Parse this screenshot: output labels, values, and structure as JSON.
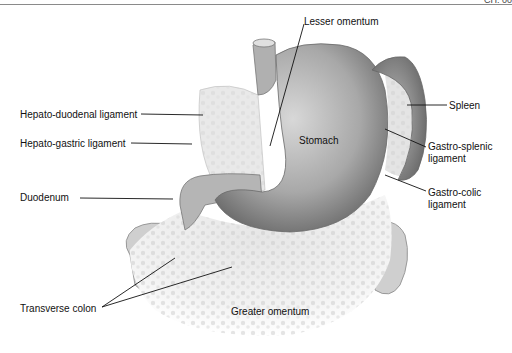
{
  "header": {
    "text": "CH. 00"
  },
  "figure": {
    "labels": {
      "lesser_omentum": "Lesser omentum",
      "hepato_duodenal": "Hepato-duodenal ligament",
      "hepato_gastric": "Hepato-gastric ligament",
      "duodenum": "Duodenum",
      "stomach": "Stomach",
      "spleen": "Spleen",
      "gastro_splenic_1": "Gastro-splenic",
      "gastro_splenic_2": "ligament",
      "gastro_colic_1": "Gastro-colic",
      "gastro_colic_2": "ligament",
      "transverse_colon": "Transverse colon",
      "greater_omentum": "Greater omentum"
    }
  }
}
